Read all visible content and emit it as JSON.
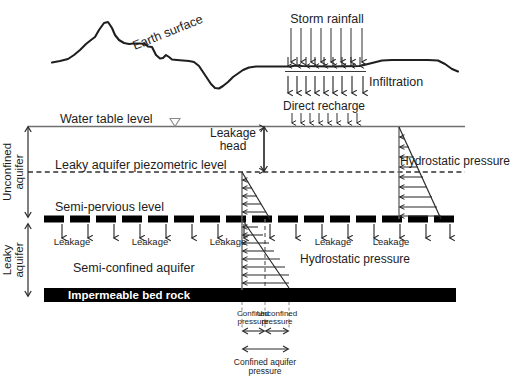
{
  "diagram": {
    "type": "hydrogeology-cross-section",
    "colors": {
      "ink": "#1a1a1a",
      "line_gray": "#6f6f6f",
      "bedrock": "#000000",
      "semi_pervious": "#000000",
      "background": "#ffffff",
      "bedrock_text": "#ffffff"
    }
  },
  "upper_panel": {
    "earth_surface_label": "Earth surface",
    "storm_rainfall_label": "Storm rainfall",
    "infiltration_label": "Infiltration",
    "rainfall_arrow_count": 8,
    "infiltration_arrow_count": 9
  },
  "lower_panel": {
    "water_table_label": "Water table level",
    "piezometric_label": "Leaky aquifer piezometric level",
    "semi_pervious_label": "Semi-pervious level",
    "semi_confined_label": "Semi-confined aquifer",
    "bedrock_label": "Impermeable bed rock",
    "direct_recharge_label": "Direct recharge",
    "direct_recharge_arrow_count": 8,
    "leakage_head_label_line1": "Leakage",
    "leakage_head_label_line2": "head",
    "hydrostatic_right_label": "Hydrostatic pressure",
    "hydrostatic_lower_label": "Hydrostatic pressure",
    "leakage_labels": [
      "Leakage",
      "Leakage",
      "Leakage",
      "Leakage",
      "Leakage"
    ],
    "leakage_arrow_count": 16,
    "side_labels": {
      "unconfined_line1": "Unconfined",
      "unconfined_line2": "aquifer",
      "leaky_line1": "Leaky",
      "leaky_line2": "aquifer"
    }
  },
  "dimension_callouts": {
    "confined_pressure_line1": "Confined",
    "confined_pressure_line2": "pressure",
    "unconfined_pressure_line1": "Unconfined",
    "unconfined_pressure_line2": "pressure",
    "confined_aquifer_pressure_line1": "Confined aquifer",
    "confined_aquifer_pressure_line2": "pressure"
  }
}
